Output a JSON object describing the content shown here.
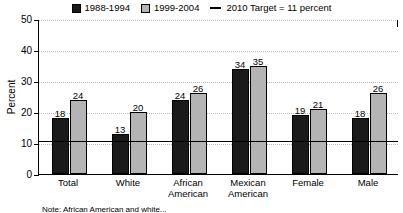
{
  "chart_data": {
    "type": "bar",
    "title": "",
    "xlabel": "",
    "ylabel": "Percent",
    "ylim": [
      0,
      50
    ],
    "yticks": [
      0,
      10,
      20,
      30,
      40,
      50
    ],
    "grid": true,
    "legend_position": "top",
    "categories": [
      "Total",
      "White",
      "African\nAmerican",
      "Mexican\nAmerican",
      "Female",
      "Male"
    ],
    "series": [
      {
        "name": "1988-1994",
        "color": "#1a1a1a",
        "values": [
          18,
          13,
          24,
          34,
          19,
          18
        ]
      },
      {
        "name": "1999-2004",
        "color": "#b4b4b4",
        "values": [
          24,
          20,
          26,
          35,
          21,
          26
        ]
      }
    ],
    "reference_line": {
      "label": "2010 Target = 11 percent",
      "value": 11,
      "color": "#000000"
    }
  },
  "legend": {
    "entries": [
      {
        "label": "1988-1994"
      },
      {
        "label": "1999-2004"
      },
      {
        "label": "2010 Target = 11 percent"
      }
    ]
  },
  "footnote": {
    "text": "Note: African American and white..."
  }
}
